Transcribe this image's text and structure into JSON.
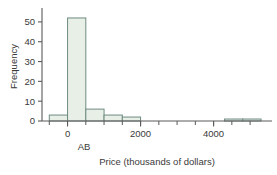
{
  "chart_data": {
    "type": "bar",
    "title": "",
    "subtitle": "",
    "xlabel": "Price (thousands of dollars)",
    "ylabel": "Frequency",
    "xlim": [
      -700,
      5600
    ],
    "ylim": [
      0,
      55
    ],
    "grid": false,
    "legend": null,
    "bar_fill_color": "#e8efe6",
    "bar_edge_color": "#6e8b82",
    "axis_color": "#5a5a5a",
    "x_tick_labels": [
      "0",
      "2000",
      "4000"
    ],
    "x_tick_values": [
      0,
      2000,
      4000
    ],
    "x_minor_tick_values": [
      -500,
      500,
      1000,
      1500,
      2000,
      2500,
      3000,
      3500,
      4000,
      4500,
      5000
    ],
    "y_tick_labels": [
      "0",
      "10",
      "20",
      "30",
      "40",
      "50"
    ],
    "y_tick_values": [
      0,
      10,
      20,
      30,
      40,
      50
    ],
    "bins": [
      {
        "start": -500,
        "end": 0,
        "value": 3
      },
      {
        "start": 0,
        "end": 500,
        "value": 52
      },
      {
        "start": 500,
        "end": 1000,
        "value": 6
      },
      {
        "start": 1000,
        "end": 1500,
        "value": 3
      },
      {
        "start": 1500,
        "end": 2000,
        "value": 2
      },
      {
        "start": 4300,
        "end": 4800,
        "value": 1
      },
      {
        "start": 4800,
        "end": 5300,
        "value": 1
      }
    ],
    "annotations": [
      {
        "text": "AB",
        "x": 450,
        "y": -9,
        "name": "ab-annotation"
      }
    ]
  }
}
